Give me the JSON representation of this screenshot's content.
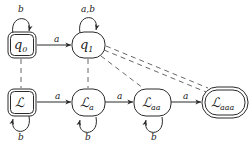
{
  "diagram": {
    "type": "automaton",
    "nodes": [
      {
        "id": "q0",
        "label": "q",
        "sub": "0",
        "shape": "double-rounded-square",
        "accepting": true
      },
      {
        "id": "q1",
        "label": "q",
        "sub": "1",
        "shape": "rounded-rect",
        "accepting": false
      },
      {
        "id": "L",
        "label": "ℒ",
        "sub": "",
        "shape": "double-rounded-square",
        "accepting": true
      },
      {
        "id": "La",
        "label": "ℒ",
        "sub": "a",
        "shape": "rounded-rect",
        "accepting": false
      },
      {
        "id": "Laa",
        "label": "ℒ",
        "sub": "aa",
        "shape": "rounded-rect",
        "accepting": false
      },
      {
        "id": "Laaa",
        "label": "ℒ",
        "sub": "aaa",
        "shape": "double-rounded-rect",
        "accepting": true
      }
    ],
    "edges": [
      {
        "from": "q0",
        "to": "q0",
        "label": "b",
        "style": "loop-top"
      },
      {
        "from": "q0",
        "to": "q1",
        "label": "a",
        "style": "solid"
      },
      {
        "from": "q1",
        "to": "q1",
        "label": "a,b",
        "style": "loop-top"
      },
      {
        "from": "L",
        "to": "L",
        "label": "b",
        "style": "loop-bottom"
      },
      {
        "from": "L",
        "to": "La",
        "label": "a",
        "style": "solid"
      },
      {
        "from": "La",
        "to": "La",
        "label": "b",
        "style": "loop-bottom"
      },
      {
        "from": "La",
        "to": "Laa",
        "label": "a",
        "style": "solid"
      },
      {
        "from": "Laa",
        "to": "Laa",
        "label": "b",
        "style": "loop-bottom"
      },
      {
        "from": "Laa",
        "to": "Laaa",
        "label": "a",
        "style": "solid"
      }
    ],
    "correspondences": [
      {
        "from": "q0",
        "to": "L",
        "style": "dashed"
      },
      {
        "from": "q1",
        "to": "La",
        "style": "dashed"
      },
      {
        "from": "q1",
        "to": "Laa",
        "style": "dashed"
      },
      {
        "from": "q1",
        "to": "Laaa",
        "style": "double-dashed"
      }
    ],
    "labels": {
      "q0": {
        "main": "q",
        "sub": "0"
      },
      "q1": {
        "main": "q",
        "sub": "1"
      },
      "L": {
        "main": "ℒ"
      },
      "La": {
        "main": "ℒ",
        "sub": "a"
      },
      "Laa": {
        "main": "ℒ",
        "sub": "aa"
      },
      "Laaa": {
        "main": "ℒ",
        "sub": "aaa"
      },
      "loop_q0": "b",
      "loop_q1": "a,b",
      "edge_q0_q1": "a",
      "loop_L": "b",
      "edge_L_La": "a",
      "loop_La": "b",
      "edge_La_Laa": "a",
      "loop_Laa": "b",
      "edge_Laa_Laaa": "a"
    }
  }
}
